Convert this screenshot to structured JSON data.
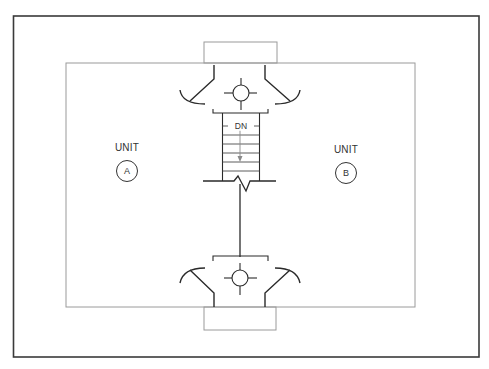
{
  "diagram": {
    "type": "floor-plan",
    "colors": {
      "outer_border": "#3a3a3a",
      "inner_walls": "#9a9a9a",
      "linework": "#2a2a2a",
      "arrow": "#8a8a8a",
      "text": "#333333"
    },
    "stair": {
      "label": "DN",
      "direction": "down",
      "tread_count": 7
    },
    "units": [
      {
        "id": "A",
        "label": "UNIT",
        "tag": "A",
        "label_pos": [
          127,
          148
        ],
        "circle_pos": [
          127,
          171
        ]
      },
      {
        "id": "B",
        "label": "UNIT",
        "tag": "B",
        "label_pos": [
          346,
          150
        ],
        "circle_pos": [
          346,
          173
        ]
      }
    ],
    "fixtures": [
      {
        "name": "top-light-fixture",
        "center": [
          240,
          93
        ]
      },
      {
        "name": "bottom-light-fixture",
        "center": [
          240,
          278
        ]
      }
    ]
  }
}
